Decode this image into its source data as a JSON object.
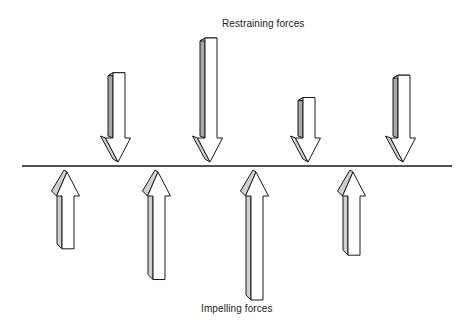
{
  "diagram": {
    "type": "force-field-analysis",
    "top_label": "Restraining forces",
    "bottom_label": "Impelling forces",
    "restraining_forces": [
      {
        "id": 1,
        "relative_strength": 0.72
      },
      {
        "id": 2,
        "relative_strength": 1.0
      },
      {
        "id": 3,
        "relative_strength": 0.52
      },
      {
        "id": 4,
        "relative_strength": 0.7
      }
    ],
    "impelling_forces": [
      {
        "id": 1,
        "relative_strength": 0.6
      },
      {
        "id": 2,
        "relative_strength": 0.84
      },
      {
        "id": 3,
        "relative_strength": 1.0
      },
      {
        "id": 4,
        "relative_strength": 0.65
      }
    ],
    "colors": {
      "stroke": "#1a1a1a",
      "arrow_fill": "#ffffff",
      "shade_light": "#d0d0d0",
      "shade_dark": "#a8a8a8"
    }
  }
}
